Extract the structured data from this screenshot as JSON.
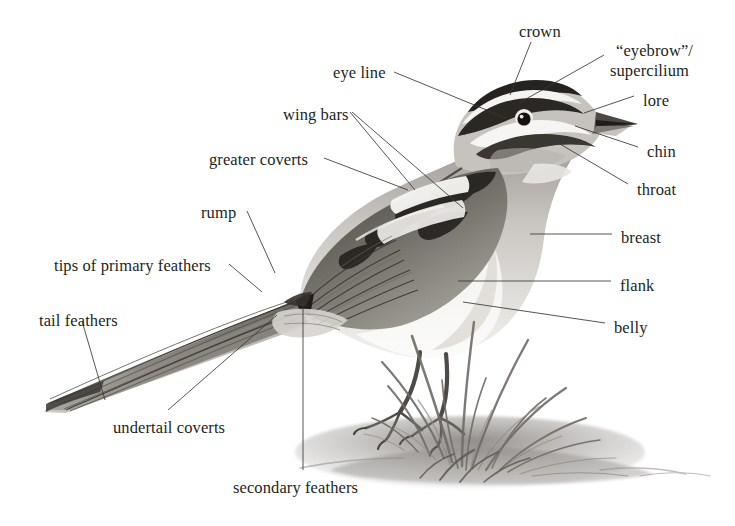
{
  "diagram": {
    "background_color": "#ffffff",
    "ink_color": "#231f1c",
    "leader_line_color": "#3a3632"
  },
  "labels": [
    {
      "id": "crown",
      "text": "crown",
      "x": 519,
      "y": 22,
      "align": "center"
    },
    {
      "id": "eyebrow-supercilium",
      "text": "“eyebrow”/",
      "x": 616,
      "y": 41,
      "align": "left"
    },
    {
      "id": "supercilium-line2",
      "text": "supercilium",
      "x": 610,
      "y": 61,
      "align": "left"
    },
    {
      "id": "eye-line",
      "text": "eye line",
      "x": 333,
      "y": 63,
      "align": "left"
    },
    {
      "id": "lore",
      "text": "lore",
      "x": 643,
      "y": 91,
      "align": "left"
    },
    {
      "id": "wing-bars",
      "text": "wing bars",
      "x": 283,
      "y": 105,
      "align": "left"
    },
    {
      "id": "chin",
      "text": "chin",
      "x": 647,
      "y": 142,
      "align": "left"
    },
    {
      "id": "greater-coverts",
      "text": "greater coverts",
      "x": 209,
      "y": 150,
      "align": "left"
    },
    {
      "id": "throat",
      "text": "throat",
      "x": 637,
      "y": 180,
      "align": "left"
    },
    {
      "id": "rump",
      "text": "rump",
      "x": 201,
      "y": 203,
      "align": "left"
    },
    {
      "id": "breast",
      "text": "breast",
      "x": 621,
      "y": 228,
      "align": "left"
    },
    {
      "id": "tips-primary",
      "text": "tips of primary feathers",
      "x": 54,
      "y": 256,
      "align": "left"
    },
    {
      "id": "flank",
      "text": "flank",
      "x": 620,
      "y": 276,
      "align": "left"
    },
    {
      "id": "tail-feathers",
      "text": "tail feathers",
      "x": 39,
      "y": 311,
      "align": "left"
    },
    {
      "id": "belly",
      "text": "belly",
      "x": 614,
      "y": 318,
      "align": "left"
    },
    {
      "id": "undertail-coverts",
      "text": "undertail coverts",
      "x": 113,
      "y": 418,
      "align": "left"
    },
    {
      "id": "secondary-feathers",
      "text": "secondary feathers",
      "x": 233,
      "y": 478,
      "align": "left"
    }
  ],
  "leader_lines": [
    {
      "id": "leader-crown",
      "points": "531,42 510,95"
    },
    {
      "id": "leader-supercilium",
      "points": "604,55 519,103"
    },
    {
      "id": "leader-lore",
      "points": "634,96 584,113"
    },
    {
      "id": "leader-eye-line",
      "points": "394,72 506,118"
    },
    {
      "id": "leader-chin",
      "points": "638,147 575,126"
    },
    {
      "id": "leader-throat",
      "points": "628,184 560,144"
    },
    {
      "id": "leader-breast",
      "points": "612,234 530,234"
    },
    {
      "id": "leader-flank",
      "points": "611,281 458,281"
    },
    {
      "id": "leader-belly",
      "points": "605,323 463,302"
    },
    {
      "id": "leader-wing-bars-a",
      "points": "350,112 415,190"
    },
    {
      "id": "leader-wing-bars-b",
      "points": "352,112 463,208"
    },
    {
      "id": "leader-greater-coverts",
      "points": "324,158 408,190"
    },
    {
      "id": "leader-rump",
      "points": "247,211 275,273"
    },
    {
      "id": "leader-tips-primary",
      "points": "229,264 262,292"
    },
    {
      "id": "leader-tail-feathers",
      "points": "82,321 105,400"
    },
    {
      "id": "leader-undertail-coverts",
      "points": "168,410 277,315"
    },
    {
      "id": "leader-secondary-feathers",
      "points": "303,470 303,301"
    }
  ]
}
